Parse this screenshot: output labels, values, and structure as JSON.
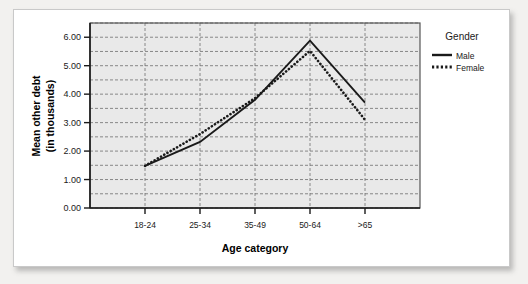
{
  "chart_data": {
    "type": "line",
    "title": "",
    "xlabel": "Age category",
    "ylabel_line1": "Mean other debt",
    "ylabel_line2": "(in thousands)",
    "categories": [
      "18-24",
      "25-34",
      "35-49",
      "50-64",
      ">65"
    ],
    "ylim": [
      0.0,
      6.5
    ],
    "yticks": [
      "0.00",
      "1.00",
      "2.00",
      "3.00",
      "4.00",
      "5.00",
      "6.00"
    ],
    "ytick_values": [
      0,
      1,
      2,
      3,
      4,
      5,
      6
    ],
    "grid": "dashed horizontal every 0.5 and vertical at each category",
    "legend_position": "right",
    "legend_title": "Gender",
    "series": [
      {
        "name": "Male",
        "style": "solid",
        "color": "#1a1a1a",
        "values": [
          1.48,
          2.32,
          3.8,
          5.88,
          3.7
        ]
      },
      {
        "name": "Female",
        "style": "dotted",
        "color": "#1a1a1a",
        "values": [
          1.48,
          2.6,
          3.86,
          5.52,
          3.1
        ]
      }
    ]
  },
  "axis": {
    "y_ticks": [
      "6.00",
      "5.00",
      "4.00",
      "3.00",
      "2.00",
      "1.00",
      "0.00"
    ],
    "x_categories": [
      "18-24",
      "25-34",
      "35-49",
      "50-64",
      ">65"
    ],
    "x_title": "Age category",
    "y_title_line1": "Mean other debt",
    "y_title_line2": "(in thousands)"
  },
  "legend": {
    "title": "Gender",
    "items": [
      {
        "label": "Male",
        "style": "solid"
      },
      {
        "label": "Female",
        "style": "dotted"
      }
    ]
  },
  "colors": {
    "plot_background": "#e9e9e9",
    "card_background": "#ffffff",
    "page_background": "#f2f1ef",
    "grid": "#6e6e6e",
    "axis": "#1a1a1a",
    "series": "#1a1a1a"
  }
}
